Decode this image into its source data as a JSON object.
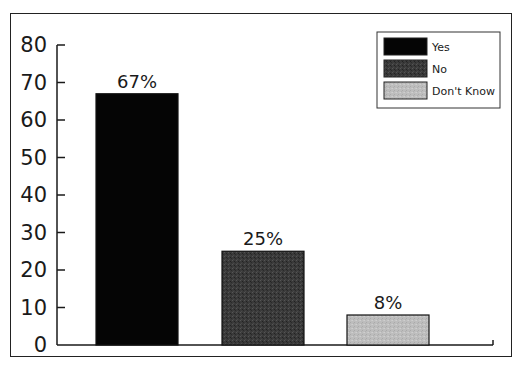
{
  "chart_data": {
    "type": "bar",
    "title": "",
    "xlabel": "",
    "ylabel": "",
    "categories": [
      "Yes",
      "No",
      "Don't Know"
    ],
    "values": [
      67,
      25,
      8
    ],
    "value_labels": [
      "67%",
      "25%",
      "8%"
    ],
    "colors": [
      "#050505",
      "#3a3a3a",
      "#bdbdbd"
    ],
    "ylim": [
      0,
      80
    ],
    "yticks": [
      0,
      10,
      20,
      30,
      40,
      50,
      60,
      70,
      80
    ],
    "ytick_labels": [
      "0",
      "10",
      "20",
      "30",
      "40",
      "50",
      "60",
      "70",
      "80"
    ],
    "grid": false,
    "legend": {
      "position": "top-right",
      "entries": [
        {
          "label": "Yes",
          "color": "#050505"
        },
        {
          "label": "No",
          "color": "#3a3a3a"
        },
        {
          "label": "Don't Know",
          "color": "#bdbdbd"
        }
      ]
    }
  }
}
